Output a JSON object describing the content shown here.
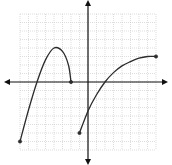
{
  "chart_data": {
    "type": "line",
    "title": "",
    "xlabel": "",
    "ylabel": "",
    "xlim": [
      -8,
      8
    ],
    "ylim": [
      -8,
      8
    ],
    "grid": true,
    "axes_arrows": true,
    "series": [
      {
        "name": "left piece",
        "x": [
          -8,
          -7,
          -6,
          -5,
          -4,
          -3,
          -2.3,
          -2
        ],
        "y": [
          -7,
          -3.3,
          0,
          2.6,
          4,
          3.6,
          2,
          0
        ],
        "endpoints": [
          {
            "x": -8,
            "y": -7,
            "closed": true
          },
          {
            "x": -2,
            "y": 0,
            "closed": true
          }
        ]
      },
      {
        "name": "right piece",
        "x": [
          -1,
          0,
          1,
          2,
          3,
          4,
          5,
          6,
          7,
          8
        ],
        "y": [
          -6,
          -3.4,
          -1.5,
          0,
          1.1,
          1.9,
          2.4,
          2.8,
          3,
          3
        ],
        "endpoints": [
          {
            "x": -1,
            "y": -6,
            "closed": true
          },
          {
            "x": 8,
            "y": 3,
            "closed": true
          }
        ]
      }
    ]
  },
  "colors": {
    "curve": "#2b2b2b",
    "axis": "#111111",
    "grid": "#c8c8c8"
  }
}
